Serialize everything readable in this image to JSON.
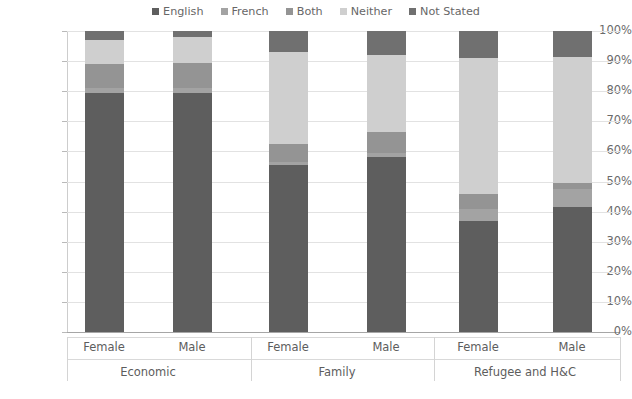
{
  "chart_data": {
    "type": "bar",
    "subtype": "stacked-percent",
    "title": "",
    "xlabel": "",
    "ylabel": "",
    "ylim": [
      0,
      100
    ],
    "ytick_labels": [
      "100%",
      "90%",
      "80%",
      "70%",
      "60%",
      "50%",
      "40%",
      "30%",
      "20%",
      "10%",
      "0%"
    ],
    "ytick_values": [
      100,
      90,
      80,
      70,
      60,
      50,
      40,
      30,
      20,
      10,
      0
    ],
    "grid": true,
    "legend_position": "top-center",
    "legend": [
      "English",
      "French",
      "Both",
      "Neither",
      "Not Stated"
    ],
    "series": [
      {
        "name": "English",
        "color": "#5e5e5e",
        "values": [
          79.5,
          79.5,
          55.5,
          58.0,
          37.0,
          41.5
        ]
      },
      {
        "name": "French",
        "color": "#a3a3a3",
        "values": [
          1.5,
          1.5,
          1.0,
          1.5,
          4.0,
          6.0
        ]
      },
      {
        "name": "Both",
        "color": "#949494",
        "values": [
          8.0,
          8.5,
          6.0,
          7.0,
          5.0,
          2.0
        ]
      },
      {
        "name": "Neither",
        "color": "#cfcfcf",
        "values": [
          8.0,
          8.5,
          30.5,
          25.5,
          45.0,
          42.0
        ]
      },
      {
        "name": "Not Stated",
        "color": "#707070",
        "values": [
          3.0,
          2.0,
          7.0,
          8.0,
          9.0,
          8.5
        ]
      }
    ],
    "categories": [
      "Female",
      "Male",
      "Female",
      "Male",
      "Female",
      "Male"
    ],
    "groups": [
      {
        "label": "Economic",
        "categories": [
          "Female",
          "Male"
        ]
      },
      {
        "label": "Family",
        "categories": [
          "Female",
          "Male"
        ]
      },
      {
        "label": "Refugee and H&C",
        "categories": [
          "Female",
          "Male"
        ]
      }
    ]
  },
  "colors": {
    "english": "#5e5e5e",
    "french": "#a3a3a3",
    "both": "#949494",
    "neither": "#cfcfcf",
    "not_stated": "#707070",
    "gridline": "#e2e2e2",
    "axis": "#a6a6a6",
    "text": "#5d5d5d",
    "background": "#ffffff"
  }
}
